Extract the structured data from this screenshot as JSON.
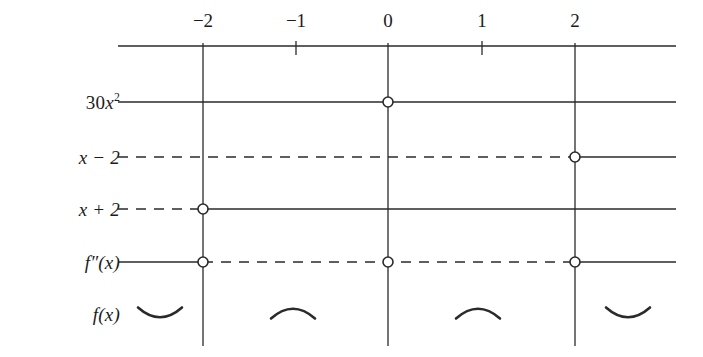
{
  "figure": {
    "kind": "sign-chart",
    "background_color": "#ffffff",
    "ink_color": "#2a2a2a",
    "text_color": "#1b1b1b"
  },
  "axis": {
    "name": "x-axis",
    "y": 46,
    "x_start": 118,
    "x_end": 676,
    "ticks": [
      {
        "value": -2,
        "label": "−2",
        "x": 203,
        "full_line": true
      },
      {
        "value": -1,
        "label": "−1",
        "x": 296,
        "full_line": false
      },
      {
        "value": 0,
        "label": "0",
        "x": 388,
        "full_line": true
      },
      {
        "value": 1,
        "label": "1",
        "x": 482,
        "full_line": false
      },
      {
        "value": 2,
        "label": "2",
        "x": 575,
        "full_line": true
      }
    ],
    "tick_label_y": 30,
    "short_tick_length": 14,
    "vertical_line_top": 43,
    "vertical_line_bottom": 346
  },
  "rows": [
    {
      "id": "row-30x2",
      "label_html": "30<span class=\"var\">x</span><sup>2</sup>",
      "label_text": "30x²",
      "label_x": 120,
      "y": 102,
      "segments": [
        {
          "from": 118,
          "to": 676,
          "style": "solid"
        }
      ],
      "zeros": [
        {
          "x": 388,
          "value": 0
        }
      ]
    },
    {
      "id": "row-x-minus-2",
      "label_html": "x − 2",
      "label_text": "x − 2",
      "label_x": 120,
      "y": 157,
      "segments": [
        {
          "from": 118,
          "to": 575,
          "style": "dashed"
        },
        {
          "from": 575,
          "to": 676,
          "style": "solid"
        }
      ],
      "zeros": [
        {
          "x": 575,
          "value": 2
        }
      ]
    },
    {
      "id": "row-x-plus-2",
      "label_html": "x + 2",
      "label_text": "x + 2",
      "label_x": 120,
      "y": 209,
      "segments": [
        {
          "from": 118,
          "to": 203,
          "style": "dashed"
        },
        {
          "from": 203,
          "to": 676,
          "style": "solid"
        }
      ],
      "zeros": [
        {
          "x": 203,
          "value": -2
        }
      ]
    },
    {
      "id": "row-f-double-prime",
      "label_html": "f″(x)",
      "label_text": "f″(x)",
      "label_x": 120,
      "y": 262,
      "segments": [
        {
          "from": 118,
          "to": 203,
          "style": "solid"
        },
        {
          "from": 203,
          "to": 575,
          "style": "dashed"
        },
        {
          "from": 575,
          "to": 676,
          "style": "solid"
        }
      ],
      "zeros": [
        {
          "x": 203,
          "value": -2
        },
        {
          "x": 388,
          "value": 0
        },
        {
          "x": 575,
          "value": 2
        }
      ]
    },
    {
      "id": "row-f",
      "label_html": "f(x)",
      "label_text": "f(x)",
      "label_x": 120,
      "y": 314,
      "segments": [],
      "zeros": []
    }
  ],
  "concavity_arcs": [
    {
      "name": "arc-concave-up-left",
      "center_x": 160,
      "y": 314,
      "shape": "concave-up",
      "interval": "x < -2"
    },
    {
      "name": "arc-concave-down-mid-left",
      "center_x": 293,
      "y": 312,
      "shape": "concave-down",
      "interval": "-2 < x < 0"
    },
    {
      "name": "arc-concave-down-mid-right",
      "center_x": 478,
      "y": 312,
      "shape": "concave-down",
      "interval": "0 < x < 2"
    },
    {
      "name": "arc-concave-up-right",
      "center_x": 628,
      "y": 314,
      "shape": "concave-up",
      "interval": "x > 2"
    }
  ],
  "marker": {
    "radius": 5,
    "fill": "#ffffff",
    "stroke": "#2a2a2a",
    "stroke_width": 1.6
  },
  "line_style": {
    "solid_width": 1.3,
    "dashed_width": 1.6,
    "dash_pattern": "10 8"
  }
}
